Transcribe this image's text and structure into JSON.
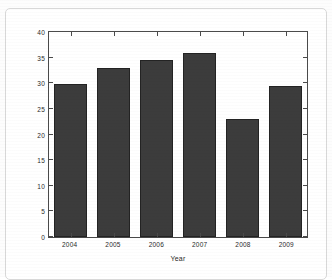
{
  "chart_data": {
    "type": "bar",
    "title": "",
    "subtitle": "",
    "xlabel": "Year",
    "ylabel": "Percentage of IXP routes",
    "categories": [
      "2004",
      "2005",
      "2006",
      "2007",
      "2008",
      "2009"
    ],
    "values": [
      29.8,
      33.0,
      34.5,
      36.0,
      23.0,
      29.4
    ],
    "series": [
      {
        "name": "Percentage of IXP routes",
        "values": [
          29.8,
          33.0,
          34.5,
          36.0,
          23.0,
          29.4
        ]
      }
    ],
    "ylim": [
      0,
      40
    ],
    "yticks": [
      0,
      5,
      10,
      15,
      20,
      25,
      30,
      35,
      40
    ],
    "ytick_labels": [
      "0",
      "5",
      "10",
      "15",
      "20",
      "25",
      "30",
      "35",
      "40"
    ],
    "grid": false,
    "legend": null,
    "legend_position": "none",
    "bar_color": "#3c3c3c",
    "bar_edge_color": "#232323",
    "axis_color": "#4a4a4a",
    "background_color": "#ffffff",
    "annotations": []
  },
  "figure": {
    "frame_color": "#d8d8d8"
  }
}
